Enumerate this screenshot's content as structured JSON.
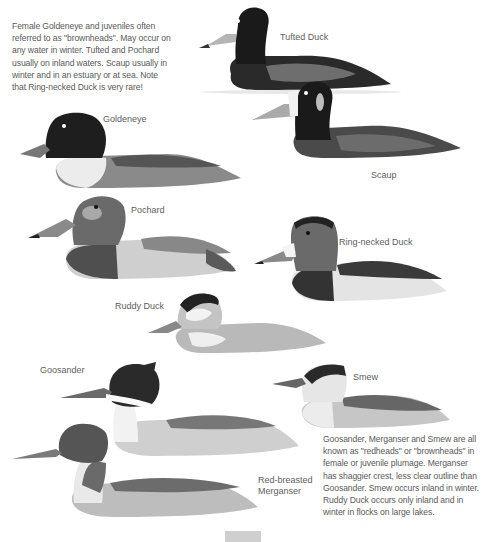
{
  "captions": {
    "top": "Female Goldeneye and juveniles often referred to as \"brownheads\". May occur on any water in winter. Tufted and Pochard usually on inland waters. Scaup usually in winter and in an estuary or at sea. Note that Ring-necked Duck is very rare!",
    "bottom": "Goosander, Merganser and Smew are all known as \"redheads\" or \"brownheads\" in female or juvenile plumage. Merganser has shaggier crest, less clear outline than Goosander. Smew occurs inland in winter. Ruddy Duck occurs only inland and in winter in flocks on large lakes."
  },
  "ducks": {
    "tufted": {
      "label": "Tufted Duck"
    },
    "scaup": {
      "label": "Scaup"
    },
    "goldeneye": {
      "label": "Goldeneye"
    },
    "pochard": {
      "label": "Pochard"
    },
    "ring_necked": {
      "label": "Ring-necked Duck"
    },
    "ruddy": {
      "label": "Ruddy Duck"
    },
    "goosander": {
      "label": "Goosander"
    },
    "smew": {
      "label": "Smew"
    },
    "merganser": {
      "label_line1": "Red-breasted",
      "label_line2": "Merganser"
    }
  },
  "colors": {
    "dark_head": "#1e1e1e",
    "brown_head": "#6a6a6a",
    "body_gray": "#8c8c8c",
    "pale_flank": "#e4e4e4",
    "bill": "#9a9a9a",
    "tab": "#cfcfcf"
  }
}
